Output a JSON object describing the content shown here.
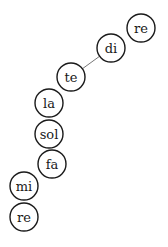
{
  "diagram": {
    "nodes": [
      {
        "id": "n0",
        "label": "re",
        "cx": 141,
        "cy": 28
      },
      {
        "id": "n1",
        "label": "di",
        "cx": 111,
        "cy": 48
      },
      {
        "id": "n2",
        "label": "te",
        "cx": 71,
        "cy": 77
      },
      {
        "id": "n3",
        "label": "la",
        "cx": 49,
        "cy": 103
      },
      {
        "id": "n4",
        "label": "sol",
        "cx": 49,
        "cy": 134
      },
      {
        "id": "n5",
        "label": "fa",
        "cx": 52,
        "cy": 164
      },
      {
        "id": "n6",
        "label": "mi",
        "cx": 24,
        "cy": 186
      },
      {
        "id": "n7",
        "label": "re",
        "cx": 24,
        "cy": 217
      }
    ],
    "edges": [
      {
        "from": "n2",
        "to": "n1"
      }
    ],
    "radius": 14
  }
}
